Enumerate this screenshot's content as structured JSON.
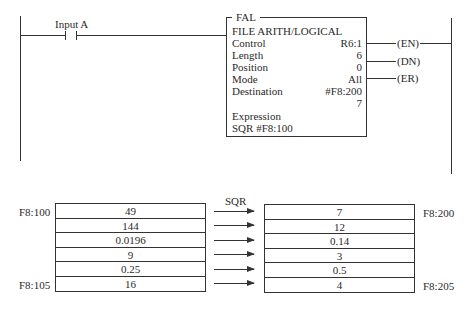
{
  "rung": {
    "input_label": "Input A",
    "instruction": {
      "type": "FAL",
      "title": "FILE ARITH/LOGICAL",
      "fields": [
        {
          "key": "Control",
          "value": "R6:1"
        },
        {
          "key": "Length",
          "value": "6"
        },
        {
          "key": "Position",
          "value": "0"
        },
        {
          "key": "Mode",
          "value": "All"
        },
        {
          "key": "Destination",
          "value": "#F8:200"
        },
        {
          "key": "",
          "value": "7"
        }
      ],
      "expression_label": "Expression",
      "expression": "SQR #F8:100"
    },
    "outputs": [
      "(EN)",
      "(DN)",
      "(ER)"
    ]
  },
  "file_diagram": {
    "operation": "SQR",
    "source": {
      "start_label": "F8:100",
      "end_label": "F8:105",
      "values": [
        "49",
        "144",
        "0.0196",
        "9",
        "0.25",
        "16"
      ]
    },
    "destination": {
      "start_label": "F8:200",
      "end_label": "F8:205",
      "values": [
        "7",
        "12",
        "0.14",
        "3",
        "0.5",
        "4"
      ]
    }
  }
}
